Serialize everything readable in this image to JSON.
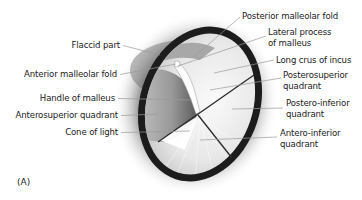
{
  "figure": {
    "panel_label": "(A)",
    "labels_left": [
      {
        "text": "Flaccid part",
        "x": 120,
        "y": 40,
        "tx": 160,
        "ty": 55
      },
      {
        "text": "Anterior malleolar fold",
        "x": 117,
        "y": 69,
        "tx": 176,
        "ty": 64
      },
      {
        "text": "Handle of malleus",
        "x": 115,
        "y": 93,
        "tx": 192,
        "ty": 100
      },
      {
        "text": "Anterosuperior quadrant",
        "x": 118,
        "y": 110,
        "tx": 158,
        "ty": 114
      },
      {
        "text": "Cone of light",
        "x": 118,
        "y": 127,
        "tx": 190,
        "ty": 131
      }
    ],
    "labels_right": [
      {
        "lines": [
          "Posterior malleolar fold"
        ],
        "x": 242,
        "y": 11,
        "sx": 240,
        "sy": 17,
        "tx": 195,
        "ty": 56
      },
      {
        "lines": [
          "Lateral process",
          "of malleus"
        ],
        "x": 268,
        "y": 27,
        "sx": 266,
        "sy": 36,
        "tx": 178,
        "ty": 66
      },
      {
        "lines": [
          "Long crus of incus"
        ],
        "x": 276,
        "y": 55,
        "sx": 274,
        "sy": 60,
        "tx": 214,
        "ty": 73
      },
      {
        "lines": [
          "Posterosuperior",
          "quadrant"
        ],
        "x": 283,
        "y": 70,
        "sx": 281,
        "sy": 78,
        "tx": 210,
        "ty": 90
      },
      {
        "lines": [
          "Postero-inferior",
          "quadrant"
        ],
        "x": 286,
        "y": 98,
        "sx": 283,
        "sy": 108,
        "tx": 232,
        "ty": 109
      },
      {
        "lines": [
          "Antero-inferior",
          "quadrant"
        ],
        "x": 280,
        "y": 128,
        "sx": 277,
        "sy": 137,
        "tx": 200,
        "ty": 140
      }
    ]
  },
  "colors": {
    "background": "#ffffff",
    "text": "#222222",
    "leader_line": "#9a9a9a",
    "annulus": "#1c1c1c",
    "membrane": "#ececec",
    "quadrant_line": "#2a2a2a"
  }
}
